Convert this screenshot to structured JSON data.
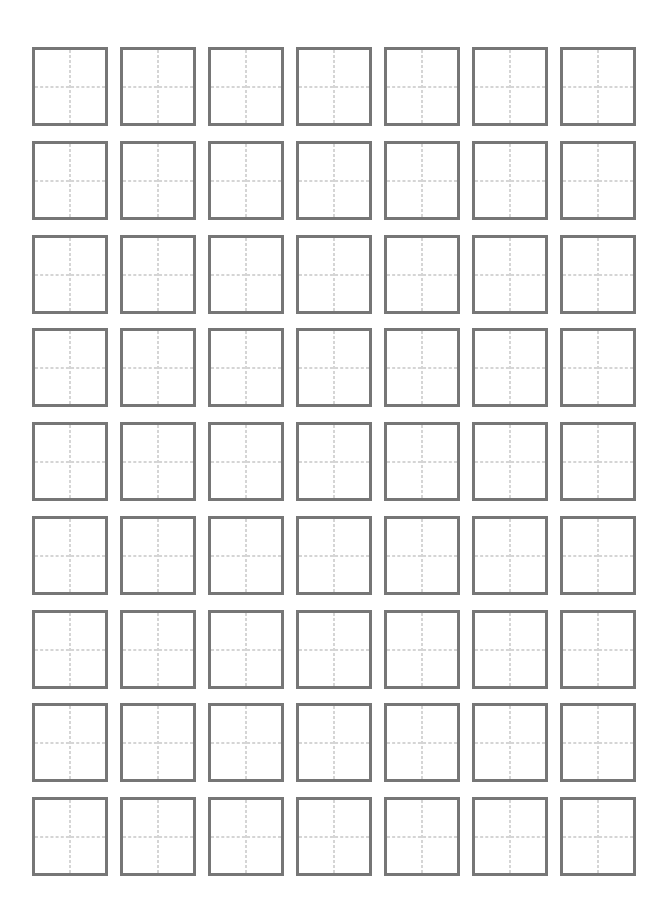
{
  "sheet": {
    "type": "tianzige-practice-grid",
    "rows": 9,
    "columns": 7,
    "cell_count": 63,
    "cells_content": "",
    "colors": {
      "border": "#767676",
      "guide_lines": "#ababab",
      "background": "#ffffff"
    }
  }
}
